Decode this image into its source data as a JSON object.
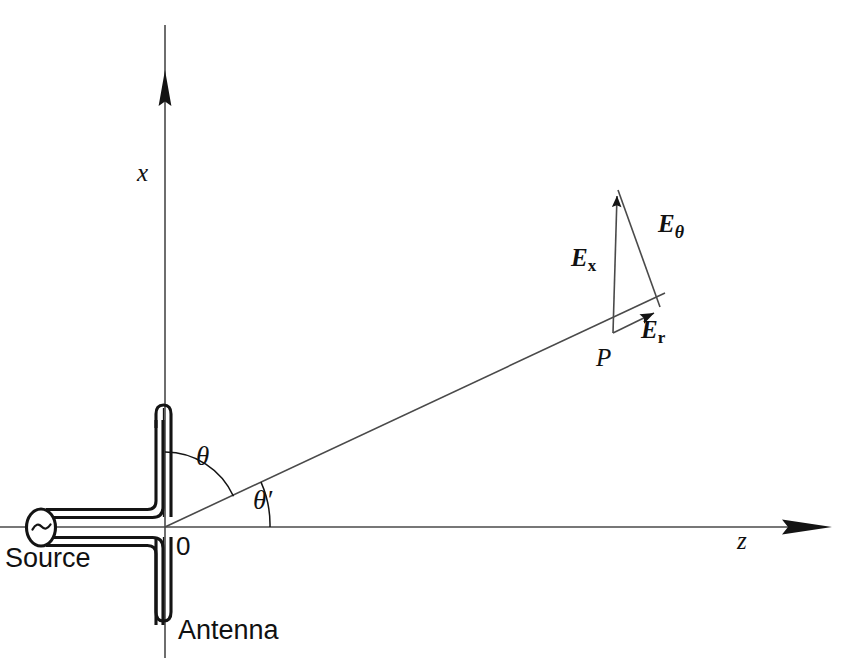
{
  "figure": {
    "background_color": "#ffffff",
    "line_color": "#1a1a1a",
    "canvas": {
      "width": 852,
      "height": 662
    }
  },
  "axes": {
    "x_label": "x",
    "z_label": "z",
    "origin_label": "0",
    "x_axis": {
      "x": 165,
      "y_top": 25,
      "y_bottom": 658,
      "arrow_tip_y": 70
    },
    "z_axis": {
      "y": 527,
      "x_left": 0,
      "x_right": 832
    }
  },
  "angles": {
    "theta_label": "θ",
    "theta_prime_label": "θ′",
    "theta_from_axis": "x",
    "theta_prime_from_axis": "z",
    "theta_degrees": 62,
    "theta_prime_degrees": 28
  },
  "source": {
    "label": "Source",
    "symbol": "~",
    "type": "ac-generator"
  },
  "antenna": {
    "label": "Antenna",
    "type": "dipole",
    "orientation": "vertical"
  },
  "point": {
    "label": "P",
    "x": 613,
    "y": 333
  },
  "vectors": [
    {
      "id": "E_x",
      "label": "E",
      "subscript": "x",
      "subscript_italic": false,
      "direction": "vertical-up",
      "description": "Cartesian x-component of electric field at P"
    },
    {
      "id": "E_r",
      "label": "E",
      "subscript": "r",
      "subscript_italic": false,
      "direction": "radial-along-ray",
      "description": "Radial component of electric field at P"
    },
    {
      "id": "E_theta",
      "label": "E",
      "subscript": "θ",
      "subscript_italic": true,
      "direction": "transverse",
      "description": "Polar (theta) component of electric field at P"
    }
  ],
  "labels": {
    "x": "x",
    "z": "z",
    "zero": "0",
    "source": "Source",
    "antenna": "Antenna",
    "point_p": "P",
    "theta": "θ",
    "theta_prime": "θ′"
  }
}
